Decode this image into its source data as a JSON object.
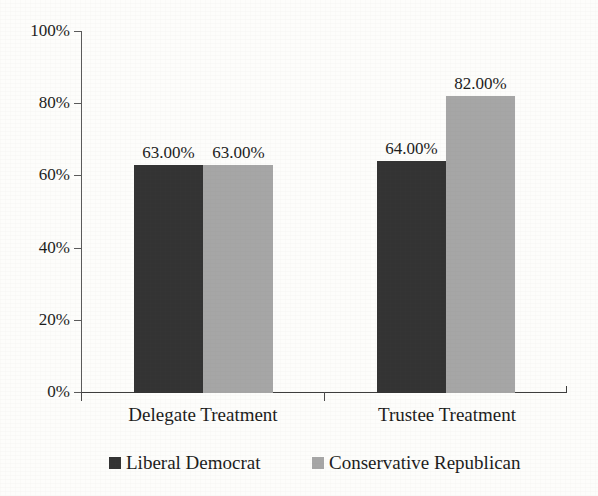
{
  "chart_data": {
    "type": "bar",
    "title": "",
    "xlabel": "",
    "ylabel": "",
    "categories": [
      "Delegate Treatment",
      "Trustee Treatment"
    ],
    "series": [
      {
        "name": "Liberal Democrat",
        "color": "#333333",
        "values": [
          63,
          64
        ],
        "value_labels": [
          "63.00%",
          "64.00%"
        ]
      },
      {
        "name": "Conservative Republican",
        "color": "#a6a6a6",
        "values": [
          63,
          82
        ],
        "value_labels": [
          "63.00%",
          "82.00%"
        ]
      }
    ],
    "ylim": [
      0,
      100
    ],
    "yticks": [
      0,
      20,
      40,
      60,
      80,
      100
    ],
    "ytick_labels": [
      "0%",
      "20%",
      "40%",
      "60%",
      "80%",
      "100%"
    ],
    "grid": false,
    "legend_position": "bottom"
  },
  "legend": {
    "items": [
      {
        "label": "Liberal Democrat",
        "marker": "square-swatch-dark"
      },
      {
        "label": "Conservative Republican",
        "marker": "square-swatch-gray"
      }
    ]
  }
}
